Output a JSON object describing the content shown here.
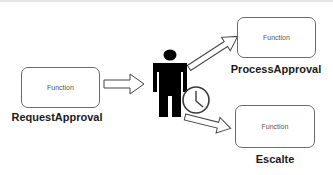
{
  "diagram": {
    "type": "workflow",
    "nodes": [
      {
        "id": "request",
        "box_text": "Function",
        "label": "RequestApproval"
      },
      {
        "id": "process",
        "box_text": "Function",
        "label": "ProcessApproval"
      },
      {
        "id": "escalate",
        "box_text": "Function",
        "label": "Escalte"
      }
    ],
    "actor": {
      "icon": "person-icon",
      "timer_icon": "clock-icon"
    },
    "edges": [
      {
        "from": "request",
        "to": "actor"
      },
      {
        "from": "actor",
        "to": "process"
      },
      {
        "from": "actor",
        "to": "escalate"
      }
    ],
    "colors": {
      "box_border": "#6b6b6b",
      "actor_fill": "#000000",
      "arrow_stroke": "#444444",
      "label_text": "#1a1a1a"
    }
  }
}
